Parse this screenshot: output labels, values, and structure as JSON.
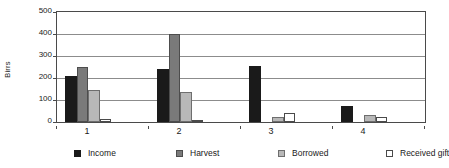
{
  "chart_data": {
    "type": "bar",
    "title": "",
    "subtitle": "",
    "xlabel": "",
    "ylabel": "Birrs",
    "categories": [
      "1",
      "2",
      "3",
      "4"
    ],
    "ylim": [
      0,
      500
    ],
    "ytick_labels": [
      "0",
      "100",
      "200",
      "300",
      "400",
      "500"
    ],
    "ytick_values": [
      0,
      100,
      200,
      300,
      400,
      500
    ],
    "grid": true,
    "legend_position": "bottom",
    "orientation": "vertical",
    "bar_layout": "grouped-adjacent",
    "series": [
      {
        "name": "Income",
        "key": "income",
        "color": "#1a1a1a",
        "values": [
          210,
          240,
          255,
          72
        ]
      },
      {
        "name": "Harvest",
        "key": "harvest",
        "color": "#7a7a7a",
        "values": [
          250,
          400,
          0,
          0
        ]
      },
      {
        "name": "Borrowed",
        "key": "borrowed",
        "color": "#b8b8b8",
        "values": [
          145,
          135,
          25,
          32
        ]
      },
      {
        "name": "Received gift",
        "key": "receivedgift",
        "color": "#ffffff",
        "values": [
          15,
          8,
          42,
          22
        ]
      }
    ]
  }
}
